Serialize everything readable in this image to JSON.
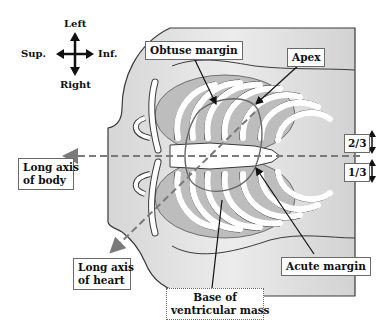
{
  "figure": {
    "type": "anatomical diagram"
  },
  "orientation": {
    "up": "Left",
    "down": "Right",
    "left": "Sup.",
    "right": "Inf."
  },
  "labels": {
    "obtuse_margin": "Obtuse margin",
    "apex": "Apex",
    "long_axis_body_line1": "Long axis",
    "long_axis_body_line2": "of body",
    "long_axis_heart_line1": "Long axis",
    "long_axis_heart_line2": "of heart",
    "acute_margin": "Acute margin",
    "base_line1": "Base of",
    "base_line2": "ventricular mass",
    "upper_fraction": "2/3",
    "lower_fraction": "1/3"
  },
  "colors": {
    "body_fill": "#e4e4e4",
    "body_gradient_edge": "#cfcfcf",
    "rib_fill": "#ffffff",
    "lung_fill": "#b9b9b9",
    "outline": "#3a3a3a",
    "axis_dash": "#7a7a7a",
    "leader": "#111111"
  }
}
